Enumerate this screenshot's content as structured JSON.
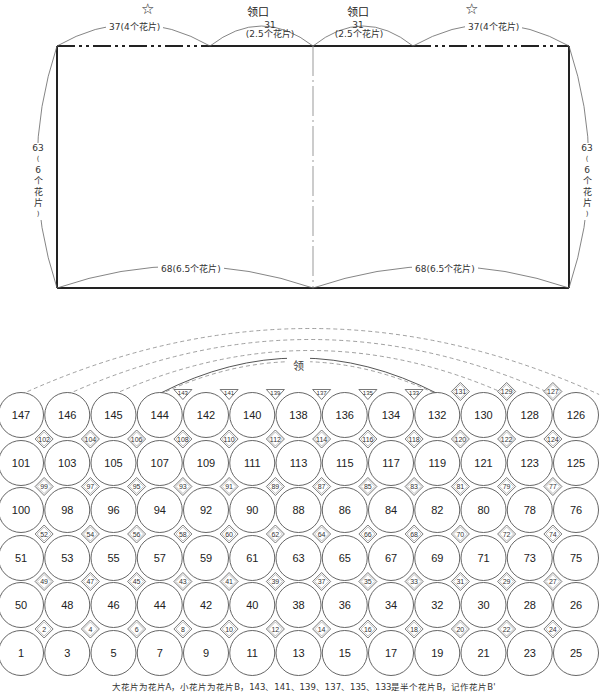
{
  "top_diagram": {
    "markers": [
      {
        "type": "star",
        "symbol": "☆",
        "x": 148
      },
      {
        "type": "text",
        "label": "领口",
        "x": 258
      },
      {
        "type": "text",
        "label": "领口",
        "x": 358
      },
      {
        "type": "star",
        "symbol": "☆",
        "x": 472
      }
    ],
    "top_labels": {
      "left_shoulder": "37(4个花片)",
      "left_neck_value": "31",
      "left_neck_sub": "(2.5个花片)",
      "right_neck_value": "31",
      "right_neck_sub": "(2.5个花片)",
      "right_shoulder": "37(4个花片)"
    },
    "side_labels": {
      "left": [
        "63",
        "(",
        "6",
        "个",
        "花",
        "片",
        ")"
      ],
      "right": [
        "63",
        "(",
        "6",
        "个",
        "花",
        "片",
        ")"
      ]
    },
    "bottom_labels": {
      "left": "68(6.5个花片)",
      "right": "68(6.5个花片)"
    },
    "rect": {
      "left": 57,
      "top": 46,
      "right": 569,
      "bottom": 288,
      "center_x": 313,
      "neck_left_x": 210,
      "neck_right_x": 413
    }
  },
  "motif_grid": {
    "neck_label": "领",
    "large_rows": [
      [
        147,
        146,
        145,
        144,
        142,
        140,
        138,
        136,
        134,
        132,
        130,
        128,
        126
      ],
      [
        101,
        103,
        105,
        107,
        109,
        111,
        113,
        115,
        117,
        119,
        121,
        123,
        125
      ],
      [
        100,
        98,
        96,
        94,
        92,
        90,
        88,
        86,
        84,
        82,
        80,
        78,
        76
      ],
      [
        51,
        53,
        55,
        57,
        59,
        61,
        63,
        65,
        67,
        69,
        71,
        73,
        75
      ],
      [
        50,
        48,
        46,
        44,
        42,
        40,
        38,
        36,
        34,
        32,
        30,
        28,
        26
      ],
      [
        1,
        3,
        5,
        7,
        9,
        11,
        13,
        15,
        17,
        19,
        21,
        23,
        25
      ]
    ],
    "top_small": {
      "half_triangles": [
        143,
        141,
        139,
        137,
        135,
        133
      ],
      "diamonds": [
        131,
        129,
        127
      ]
    },
    "small_rows": [
      [
        102,
        104,
        106,
        108,
        110,
        112,
        114,
        116,
        118,
        120,
        122,
        124
      ],
      [
        99,
        97,
        95,
        93,
        91,
        89,
        87,
        85,
        83,
        81,
        79,
        77
      ],
      [
        52,
        54,
        56,
        58,
        60,
        62,
        64,
        66,
        68,
        70,
        72,
        74
      ],
      [
        49,
        47,
        45,
        43,
        41,
        39,
        37,
        35,
        33,
        31,
        29,
        27
      ],
      [
        2,
        4,
        6,
        8,
        10,
        12,
        14,
        16,
        18,
        20,
        22,
        24
      ]
    ]
  },
  "caption": "大花片为花片A，小花片为花片B，143、141、139、137、135、133是半个花片B，记作花片B'",
  "colors": {
    "line": "#222222",
    "thin": "#666666",
    "dash": "#888888"
  }
}
